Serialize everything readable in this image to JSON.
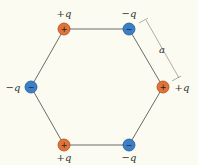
{
  "diagram": {
    "side_label": "a",
    "charges": [
      {
        "id": "top-left",
        "label": "+q",
        "sign": "+",
        "x": 64,
        "y": 29,
        "lx": 64,
        "ly": 17
      },
      {
        "id": "top-right",
        "label": "−q",
        "sign": "−",
        "x": 129,
        "y": 29,
        "lx": 129,
        "ly": 17
      },
      {
        "id": "right",
        "label": "+q",
        "sign": "+",
        "x": 163,
        "y": 87,
        "lx": 182,
        "ly": 91
      },
      {
        "id": "bottom-right",
        "label": "−q",
        "sign": "−",
        "x": 129,
        "y": 145,
        "lx": 129,
        "ly": 161
      },
      {
        "id": "bottom-left",
        "label": "+q",
        "sign": "+",
        "x": 64,
        "y": 145,
        "lx": 64,
        "ly": 161
      },
      {
        "id": "left",
        "label": "−q",
        "sign": "−",
        "x": 31,
        "y": 87,
        "lx": 13,
        "ly": 91
      }
    ],
    "colors": {
      "positive": "#e0733a",
      "negative": "#3d7fc6",
      "edge": "#555555",
      "background": "#fcfbf1"
    }
  }
}
